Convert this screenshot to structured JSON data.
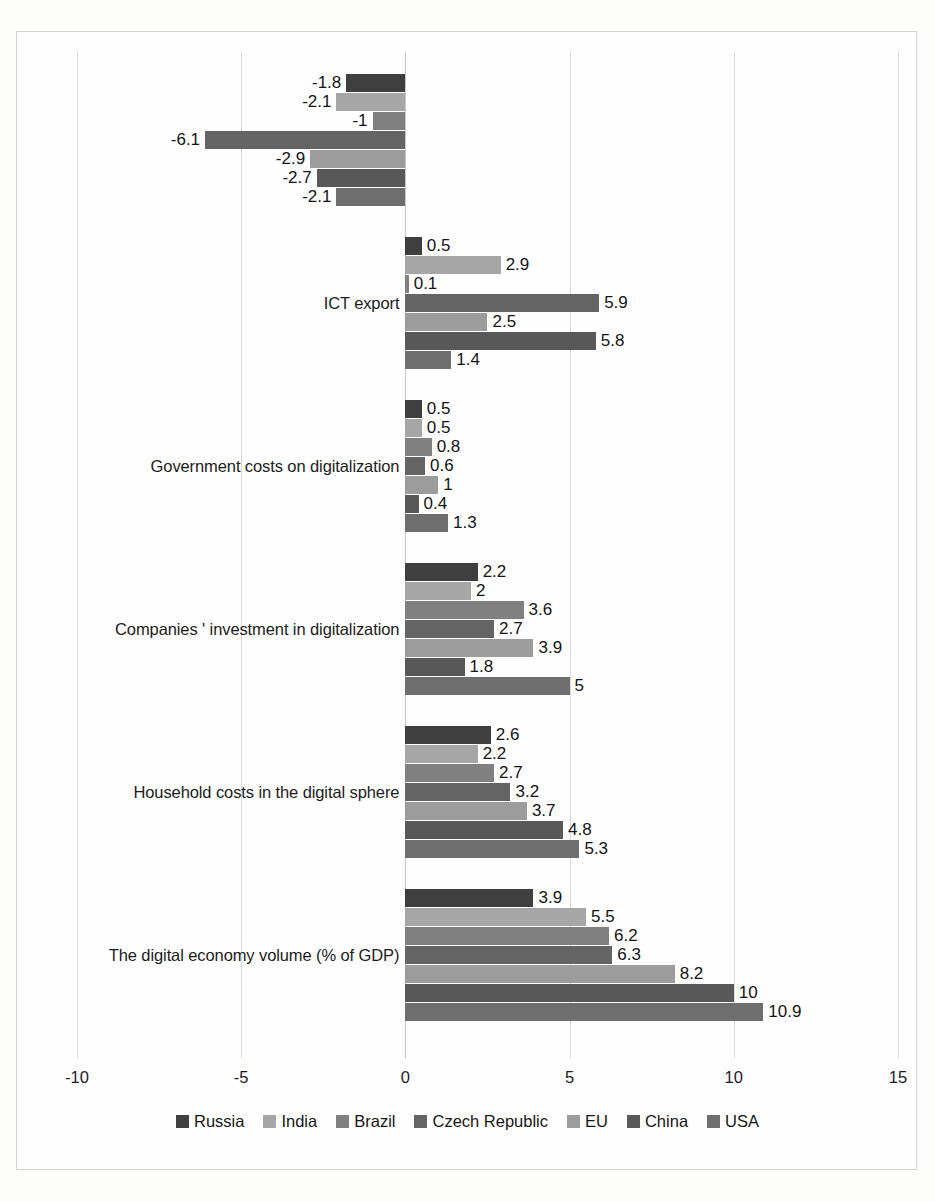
{
  "chart_data": {
    "type": "bar",
    "orientation": "horizontal",
    "title": "",
    "xlabel": "",
    "ylabel": "",
    "xlim": [
      -10,
      15
    ],
    "xticks": [
      -10,
      -5,
      0,
      5,
      10,
      15
    ],
    "xtick_labels": [
      "-10",
      "-5",
      "0",
      "5",
      "10",
      "15"
    ],
    "grid": true,
    "legend_position": "bottom",
    "categories": [
      "ICT import",
      "ICT export",
      "Government costs on digitalization",
      "Companies ' investment in digitalization",
      "Household costs in the digital sphere",
      "The digital economy volume (% of GDP)"
    ],
    "series": [
      {
        "name": "Russia",
        "color": "#3f3f3f",
        "values": [
          -1.8,
          0.5,
          0.5,
          2.2,
          2.6,
          3.9
        ]
      },
      {
        "name": "India",
        "color": "#a6a6a6",
        "values": [
          -2.1,
          2.9,
          0.5,
          2.0,
          2.2,
          5.5
        ]
      },
      {
        "name": "Brazil",
        "color": "#808080",
        "values": [
          -1.0,
          0.1,
          0.8,
          3.6,
          2.7,
          6.2
        ]
      },
      {
        "name": "Czech Republic",
        "color": "#646464",
        "values": [
          -6.1,
          5.9,
          0.6,
          2.7,
          3.2,
          6.3
        ]
      },
      {
        "name": "EU",
        "color": "#9c9c9c",
        "values": [
          -2.9,
          2.5,
          1.0,
          3.9,
          3.7,
          8.2
        ]
      },
      {
        "name": "China",
        "color": "#585858",
        "values": [
          -2.7,
          5.8,
          0.4,
          1.8,
          4.8,
          10.0
        ]
      },
      {
        "name": "USA",
        "color": "#6e6e6e",
        "values": [
          -2.1,
          1.4,
          1.3,
          5.0,
          5.3,
          10.9
        ]
      }
    ],
    "value_labels": [
      [
        "-1.8",
        "-2.1",
        "-1",
        "-6.1",
        "-2.9",
        "-2.7",
        "-2.1"
      ],
      [
        "0.5",
        "2.9",
        "0.1",
        "5.9",
        "2.5",
        "5.8",
        "1.4"
      ],
      [
        "0.5",
        "0.5",
        "0.8",
        "0.6",
        "1",
        "0.4",
        "1.3"
      ],
      [
        "2.2",
        "2",
        "3.6",
        "2.7",
        "3.9",
        "1.8",
        "5"
      ],
      [
        "2.6",
        "2.2",
        "2.7",
        "3.2",
        "3.7",
        "4.8",
        "5.3"
      ],
      [
        "3.9",
        "5.5",
        "6.2",
        "6.3",
        "8.2",
        "10",
        "10.9"
      ]
    ]
  },
  "legend": {
    "items": [
      {
        "label": "Russia"
      },
      {
        "label": "India"
      },
      {
        "label": "Brazil"
      },
      {
        "label": "Czech Republic"
      },
      {
        "label": "EU"
      },
      {
        "label": "China"
      },
      {
        "label": "USA"
      }
    ]
  }
}
